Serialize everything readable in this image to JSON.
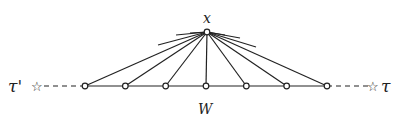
{
  "diagram": {
    "apex_label": "x",
    "base_label": "W",
    "left_end_label": "τ'",
    "right_end_label": "τ",
    "base_node_count": 7,
    "end_marker": "☆",
    "colors": {
      "ink": "#222222",
      "background": "#ffffff"
    }
  }
}
